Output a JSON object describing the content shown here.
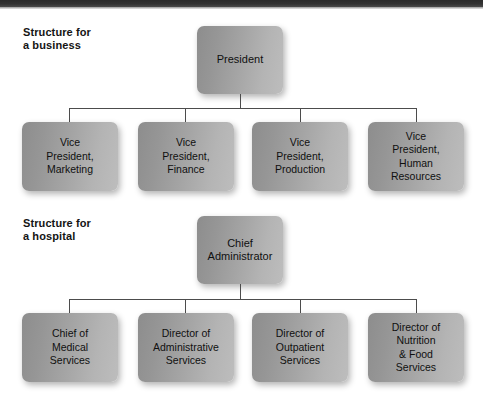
{
  "figure": {
    "background_color": "#ffffff",
    "node_fill_left": "#8d8d8d",
    "node_fill_right": "#bdbdbd",
    "line_color": "#4c4c4c",
    "text_color": "#101010",
    "top_band_color": "#2b2b2b"
  },
  "sections": [
    {
      "caption": "Structure for\na business",
      "root": {
        "label": "President"
      },
      "children": [
        {
          "label": "Vice\nPresident,\nMarketing"
        },
        {
          "label": "Vice\nPresident,\nFinance"
        },
        {
          "label": "Vice\nPresident,\nProduction"
        },
        {
          "label": "Vice\nPresident,\nHuman\nResources"
        }
      ]
    },
    {
      "caption": "Structure for\na hospital",
      "root": {
        "label": "Chief\nAdministrator"
      },
      "children": [
        {
          "label": "Chief of\nMedical\nServices"
        },
        {
          "label": "Director of\nAdministrative\nServices"
        },
        {
          "label": "Director of\nOutpatient\nServices"
        },
        {
          "label": "Director of\nNutrition\n& Food\nServices"
        }
      ]
    }
  ]
}
